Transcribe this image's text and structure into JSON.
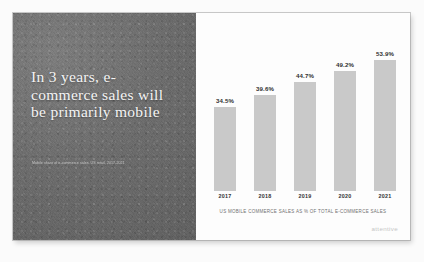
{
  "slide": {
    "headline": "In 3 years, e-commerce sales will be primarily mobile",
    "subcaption": "Mobile share of e-commerce sales, US retail, 2017-2021",
    "logo": "attentive",
    "colors": {
      "left_panel": "#6c6c6c",
      "right_panel": "#fdfdfd",
      "bar": "#c9c9c9",
      "headline_text": "#f4f4f4",
      "label_text": "#2e2e2e",
      "caption_text": "#707070",
      "logo_text": "#c5c5c5"
    }
  },
  "chart_data": {
    "type": "bar",
    "title": "",
    "categories": [
      "2017",
      "2018",
      "2019",
      "2020",
      "2021"
    ],
    "values": [
      34.5,
      39.6,
      44.7,
      49.2,
      53.9
    ],
    "value_labels": [
      "34.5%",
      "39.6%",
      "44.7%",
      "49.2%",
      "53.9%"
    ],
    "caption": "US MOBILE COMMERCE SALES AS % OF TOTAL E-COMMERCE SALES",
    "xlabel": "",
    "ylabel": "",
    "ylim": [
      0,
      60
    ],
    "grid": false,
    "legend": false
  }
}
